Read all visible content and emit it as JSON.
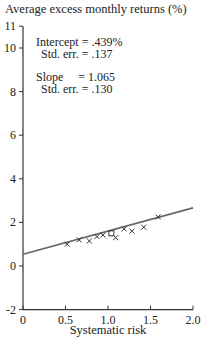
{
  "chart_data": {
    "type": "scatter",
    "title": "Average excess monthly returns (%)",
    "xlabel": "Systematic risk",
    "ylabel": "Average excess monthly returns (%)",
    "xlim": [
      0,
      2.0
    ],
    "ylim": [
      -2,
      11
    ],
    "x_ticks": [
      "0",
      "0.5",
      "1.0",
      "1.5",
      "2.0"
    ],
    "y_ticks": [
      "-2",
      "0",
      "2",
      "4",
      "6",
      "8",
      "10",
      "11"
    ],
    "grid": false,
    "points": [
      {
        "x": 0.52,
        "y": 1.0,
        "marker": "x"
      },
      {
        "x": 0.66,
        "y": 1.2,
        "marker": "x"
      },
      {
        "x": 0.78,
        "y": 1.15,
        "marker": "x"
      },
      {
        "x": 0.87,
        "y": 1.35,
        "marker": "x"
      },
      {
        "x": 0.94,
        "y": 1.42,
        "marker": "x"
      },
      {
        "x": 1.04,
        "y": 1.5,
        "marker": "square"
      },
      {
        "x": 1.09,
        "y": 1.3,
        "marker": "x"
      },
      {
        "x": 1.19,
        "y": 1.7,
        "marker": "x"
      },
      {
        "x": 1.28,
        "y": 1.6,
        "marker": "x"
      },
      {
        "x": 1.42,
        "y": 1.78,
        "marker": "x"
      },
      {
        "x": 1.59,
        "y": 2.25,
        "marker": "x"
      }
    ],
    "fit_line": {
      "intercept": 0.439,
      "slope": 1.065,
      "x_range": [
        0,
        2.0
      ]
    },
    "annotations": {
      "intercept_label": "Intercept =  .439%",
      "intercept_se": "Std. err. =  .137",
      "slope_label": "Slope     = 1.065",
      "slope_se": "Std. err. =  .130"
    }
  }
}
